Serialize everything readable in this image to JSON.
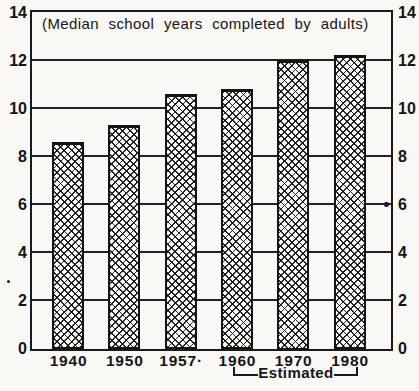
{
  "chart_data": {
    "type": "bar",
    "title": "(Median school years completed by adults)",
    "categories": [
      "1940",
      "1950",
      "1957·",
      "1960",
      "1970",
      "1980"
    ],
    "values": [
      8.6,
      9.3,
      10.6,
      10.8,
      12.0,
      12.2
    ],
    "xlabel": "",
    "ylabel": "",
    "ylim": [
      0,
      14
    ],
    "yticks": [
      0,
      2,
      4,
      6,
      8,
      10,
      12,
      14
    ],
    "ytick_side": "both",
    "grid": true,
    "bar_fill": "black-and-white crosshatch",
    "annotation": {
      "label": "Estimated",
      "span_categories": [
        "1960",
        "1970",
        "1980"
      ]
    }
  },
  "colors": {
    "ink": "#1a1a1a",
    "paper": "#f9f8f4"
  }
}
